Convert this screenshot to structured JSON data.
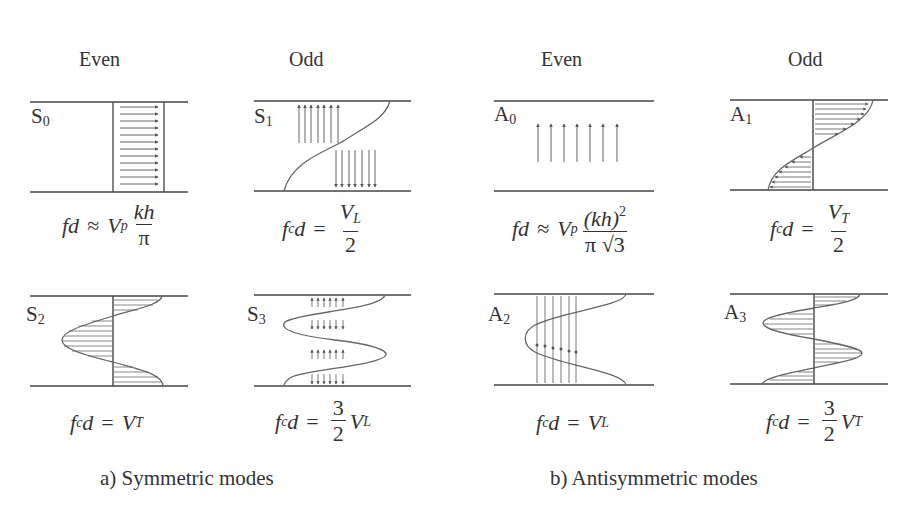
{
  "figure": {
    "columns": {
      "even_left": "Even",
      "odd_left": "Odd",
      "even_right": "Even",
      "odd_right": "Odd"
    },
    "modes": {
      "S0": {
        "name": "S",
        "index": "0",
        "parity": "Even",
        "formula": {
          "lhs": "fd",
          "rel": "≈",
          "coef": "V",
          "coef_sub": "p",
          "num": "kh",
          "den": "π"
        }
      },
      "S1": {
        "name": "S",
        "index": "1",
        "parity": "Odd",
        "formula": {
          "lhs": "f",
          "lhs_sub": "c",
          "lhs2": "d",
          "rel": "=",
          "num": "V",
          "num_sub": "L",
          "den": "2"
        }
      },
      "A0": {
        "name": "A",
        "index": "0",
        "parity": "Even",
        "formula": {
          "lhs": "fd",
          "rel": "≈",
          "coef": "V",
          "coef_sub": "p",
          "num": "(kh)",
          "num_sup": "2",
          "den_pi": "π",
          "den_sqrt": "√3"
        }
      },
      "A1": {
        "name": "A",
        "index": "1",
        "parity": "Odd",
        "formula": {
          "lhs": "f",
          "lhs_sub": "c",
          "lhs2": "d",
          "rel": "=",
          "num": "V",
          "num_sub": "T",
          "den": "2"
        }
      },
      "S2": {
        "name": "S",
        "index": "2",
        "parity": "Even",
        "formula": {
          "lhs": "f",
          "lhs_sub": "c",
          "lhs2": "d",
          "rel": "=",
          "rhs": "V",
          "rhs_sub": "T"
        }
      },
      "S3": {
        "name": "S",
        "index": "3",
        "parity": "Odd",
        "formula": {
          "lhs": "f",
          "lhs_sub": "c",
          "lhs2": "d",
          "rel": "=",
          "num": "3",
          "den": "2",
          "rhs": "V",
          "rhs_sub": "L"
        }
      },
      "A2": {
        "name": "A",
        "index": "2",
        "parity": "Even",
        "formula": {
          "lhs": "f",
          "lhs_sub": "c",
          "lhs2": "d",
          "rel": "=",
          "rhs": "V",
          "rhs_sub": "L"
        }
      },
      "A3": {
        "name": "A",
        "index": "3",
        "parity": "Odd",
        "formula": {
          "lhs": "f",
          "lhs_sub": "c",
          "lhs2": "d",
          "rel": "=",
          "num": "3",
          "den": "2",
          "rhs": "V",
          "rhs_sub": "T"
        }
      }
    },
    "captions": {
      "left": "a) Symmetric modes",
      "right": "b) Antisymmetric modes"
    },
    "colors": {
      "line": "#444444",
      "curve": "#666666",
      "arrow": "#555555",
      "text": "#333333"
    }
  }
}
